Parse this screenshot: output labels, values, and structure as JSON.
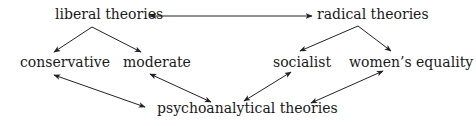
{
  "diagram": {
    "nodes": {
      "liberal": "liberal theories",
      "radical": "radical theories",
      "conservative": "conservative",
      "moderate": "moderate",
      "socialist": "socialist",
      "womens": "women’s equality",
      "psycho": "psychoanalytical theories"
    },
    "edges": [
      {
        "from": "liberal theories",
        "to": "radical theories",
        "type": "bidirectional"
      },
      {
        "from": "liberal theories",
        "to": "conservative",
        "type": "directed"
      },
      {
        "from": "liberal theories",
        "to": "moderate",
        "type": "directed"
      },
      {
        "from": "radical theories",
        "to": "socialist",
        "type": "directed"
      },
      {
        "from": "radical theories",
        "to": "women’s equality",
        "type": "directed"
      },
      {
        "from": "conservative",
        "to": "psychoanalytical theories",
        "type": "bidirectional"
      },
      {
        "from": "moderate",
        "to": "psychoanalytical theories",
        "type": "bidirectional"
      },
      {
        "from": "socialist",
        "to": "psychoanalytical theories",
        "type": "bidirectional"
      },
      {
        "from": "women’s equality",
        "to": "psychoanalytical theories",
        "type": "bidirectional"
      }
    ],
    "colors": {
      "text": "#1a1a1a",
      "line": "#222222",
      "background": "#ffffff"
    }
  }
}
